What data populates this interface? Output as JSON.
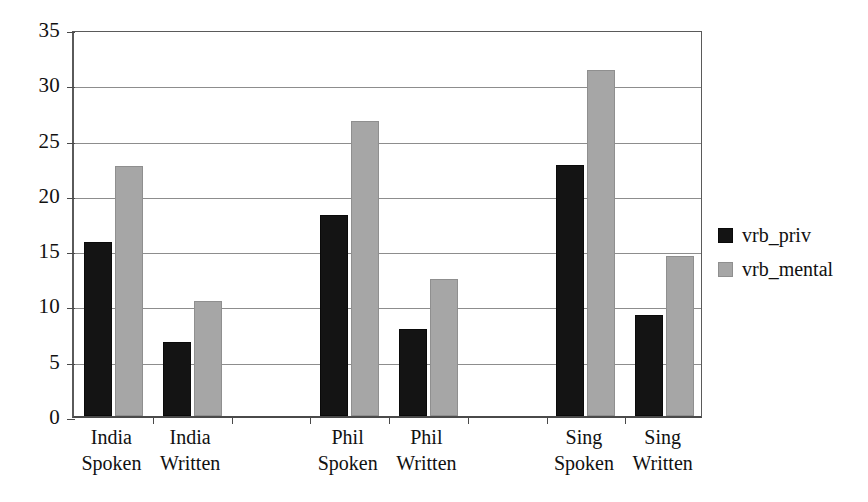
{
  "chart_data": {
    "type": "bar",
    "title": "",
    "xlabel": "",
    "ylabel": "",
    "ylim": [
      0,
      35
    ],
    "yticks": [
      0,
      5,
      10,
      15,
      20,
      25,
      30,
      35
    ],
    "ytick_labels": [
      "0",
      "5",
      "10",
      "15",
      "20",
      "25",
      "30",
      "35"
    ],
    "grid": true,
    "legend_position": "right",
    "categories": [
      "India Spoken",
      "India Written",
      "",
      "Phil Spoken",
      "Phil Written",
      "",
      "Sing Spoken",
      "Sing Written"
    ],
    "category_lines": [
      {
        "line1": "India",
        "line2": "Spoken"
      },
      {
        "line1": "India",
        "line2": "Written"
      },
      {
        "line1": "",
        "line2": ""
      },
      {
        "line1": "Phil",
        "line2": "Spoken"
      },
      {
        "line1": "Phil",
        "line2": "Written"
      },
      {
        "line1": "",
        "line2": ""
      },
      {
        "line1": "Sing",
        "line2": "Spoken"
      },
      {
        "line1": "Sing",
        "line2": "Written"
      }
    ],
    "series": [
      {
        "name": "vrb_priv",
        "color": "#141414",
        "values": [
          15.7,
          6.7,
          null,
          18.2,
          7.9,
          null,
          22.7,
          9.1
        ]
      },
      {
        "name": "vrb_mental",
        "color": "#a6a6a6",
        "values": [
          22.6,
          10.4,
          null,
          26.7,
          12.4,
          null,
          31.3,
          14.5
        ]
      }
    ]
  },
  "legend": {
    "items": [
      {
        "label": "vrb_priv",
        "color": "#141414"
      },
      {
        "label": "vrb_mental",
        "color": "#a6a6a6"
      }
    ]
  },
  "colors": {
    "series_priv": "#141414",
    "series_mental": "#a6a6a6",
    "axis": "#4a4a4a",
    "gridline": "#8d8d8d",
    "background": "#ffffff",
    "text": "#111111"
  }
}
